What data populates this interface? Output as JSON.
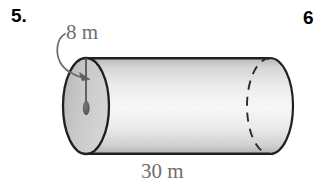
{
  "page": {
    "background_color": "#ffffff",
    "width": 319,
    "height": 192
  },
  "problems": {
    "current": {
      "number_label": "5.",
      "figure": {
        "shape_name": "cylinder",
        "orientation": "horizontal",
        "labels": {
          "radius_label": "8 m",
          "length_label": "30 m"
        },
        "annotation": {
          "leader_type": "curved-arrow",
          "points_to": "radius-line",
          "center_marker": "center-dot"
        },
        "colors": {
          "outline": "#231f20",
          "left_face_fill": "#c9c9c9",
          "body_fill_light": "#f4f4f4",
          "body_fill_dark": "#c4c4c4",
          "label_text": "#6e6e6e",
          "number_text": "#000000",
          "hidden_edge": "#2b2b2b"
        }
      }
    },
    "next": {
      "number_label": "6"
    }
  }
}
